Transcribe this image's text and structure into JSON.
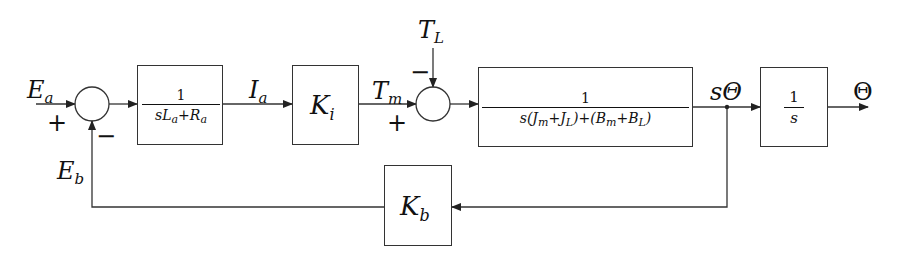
{
  "diagram": {
    "type": "control-block-diagram",
    "colors": {
      "line": "#333333",
      "text": "#111111",
      "background": "#ffffff"
    },
    "signals": {
      "input": {
        "base": "E",
        "sub": "a"
      },
      "back_emf": {
        "base": "E",
        "sub": "b"
      },
      "current": {
        "base": "I",
        "sub": "a"
      },
      "motor_torque": {
        "base": "T",
        "sub": "m"
      },
      "load_torque": {
        "base": "T",
        "sub": "L"
      },
      "velocity": {
        "text": "sΘ"
      },
      "output": {
        "text": "Θ"
      }
    },
    "summing_junctions": [
      {
        "id": "sum1",
        "signs": {
          "input": "+",
          "feedback": "−"
        }
      },
      {
        "id": "sum2",
        "signs": {
          "input": "+",
          "disturbance": "−"
        }
      }
    ],
    "blocks": {
      "electrical": {
        "num": "1",
        "den_parts": [
          "sL",
          "a",
          "+R",
          "a"
        ]
      },
      "torque_gain": {
        "base": "K",
        "sub": "i"
      },
      "mechanical": {
        "num": "1",
        "den_parts": [
          "s(J",
          "m",
          "+J",
          "L",
          ")+(B",
          "m",
          "+B",
          "L",
          ")"
        ]
      },
      "integrator": {
        "num": "1",
        "den": "s"
      },
      "back_emf_gain": {
        "base": "K",
        "sub": "b"
      }
    }
  }
}
